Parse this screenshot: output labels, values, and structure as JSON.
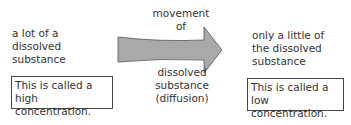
{
  "left": {
    "description": [
      "a lot of a",
      "dissolved",
      "substance"
    ],
    "box": [
      "This is called a",
      "high concentration."
    ]
  },
  "middle": {
    "top_label": [
      "movement",
      "of"
    ],
    "bottom_label": [
      "dissolved",
      "substance",
      "(diffusion)"
    ],
    "arrow_color": "#a9a9a9",
    "arrow_stroke": "#555555"
  },
  "right": {
    "description": [
      "only a little of",
      "the dissolved",
      "substance"
    ],
    "box": [
      "This is called a",
      "low concentration."
    ]
  }
}
